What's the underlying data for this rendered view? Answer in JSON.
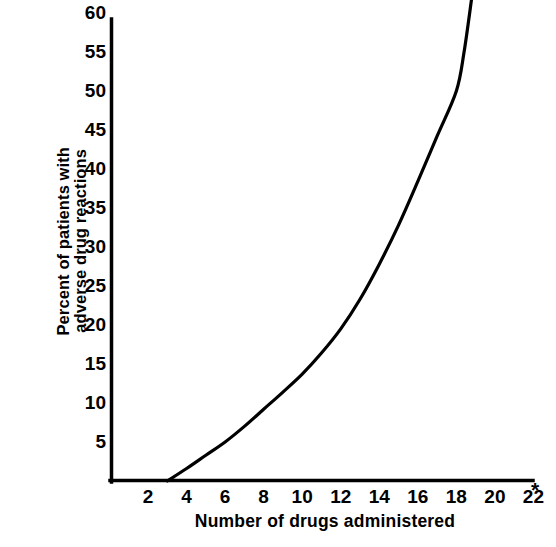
{
  "chart_data": {
    "type": "line",
    "title": "",
    "xlabel": "Number of drugs administered",
    "ylabel": "Percent of patients with adverse drug reactions",
    "ylabel_lines": [
      "Percent of patients with",
      "adverse drug reactions"
    ],
    "x_ticks": [
      2,
      4,
      6,
      8,
      10,
      12,
      14,
      16,
      18,
      20,
      22
    ],
    "x_tick_labels": [
      "2",
      "4",
      "6",
      "8",
      "10",
      "12",
      "14",
      "16",
      "18",
      "20",
      "22"
    ],
    "x_axis_note": "*",
    "y_ticks": [
      5,
      10,
      15,
      20,
      25,
      30,
      35,
      40,
      45,
      50,
      55,
      60
    ],
    "y_tick_labels": [
      "5",
      "10",
      "15",
      "20",
      "25",
      "30",
      "35",
      "40",
      "45",
      "50",
      "55",
      "60"
    ],
    "xlim": [
      0,
      22.8
    ],
    "ylim": [
      0,
      62.5
    ],
    "grid": false,
    "legend": null,
    "line_color": "#000000",
    "axis_color": "#000000",
    "background_color": "#ffffff",
    "series": [
      {
        "name": "adverse drug reactions",
        "x": [
          3.0,
          4.0,
          5.0,
          6.0,
          7.0,
          8.0,
          9.0,
          10.0,
          11.0,
          12.0,
          13.0,
          14.0,
          15.0,
          16.0,
          17.0,
          18.0,
          18.4,
          18.8
        ],
        "values": [
          0.0,
          1.6,
          3.3,
          5.0,
          7.0,
          9.2,
          11.4,
          13.7,
          16.4,
          19.5,
          23.3,
          27.8,
          32.8,
          38.4,
          44.2,
          50.0,
          55.0,
          62.0
        ]
      }
    ]
  },
  "figure": {
    "y_axis_title_line1": "Percent of patients with",
    "y_axis_title_line2": "adverse drug reactions",
    "x_axis_title": "Number of drugs administered",
    "footnote_marker": "*"
  }
}
